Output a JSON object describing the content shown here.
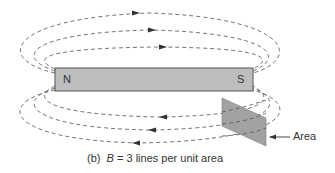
{
  "figure": {
    "magnet": {
      "north_label": "N",
      "south_label": "S",
      "fill_color": "#bdbdbd",
      "stroke_color": "#555555"
    },
    "field_lines": {
      "count_per_side": 3,
      "style": "dashed",
      "color": "#666666",
      "direction_above": "right",
      "direction_below": "left"
    },
    "area_plate": {
      "label": "Area",
      "fill_color": "#9e9e9e"
    },
    "caption": {
      "panel": "(b)",
      "symbol": "B",
      "text": "= 3 lines per unit area"
    }
  }
}
